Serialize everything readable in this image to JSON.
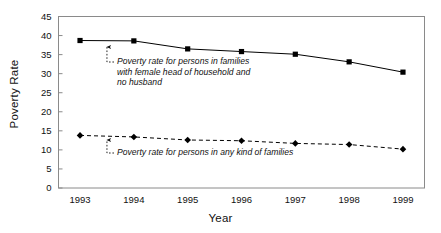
{
  "chart_data": {
    "type": "line",
    "title": "",
    "xlabel": "Year",
    "ylabel": "Poverty Rate",
    "categories": [
      "1993",
      "1994",
      "1995",
      "1996",
      "1997",
      "1998",
      "1999"
    ],
    "x": [
      1993,
      1994,
      1995,
      1996,
      1997,
      1998,
      1999
    ],
    "xlim": [
      1992.6,
      1999.4
    ],
    "ylim": [
      0,
      45
    ],
    "yticks": [
      0,
      5,
      10,
      15,
      20,
      25,
      30,
      35,
      40,
      45
    ],
    "ytick_labels": [
      "0",
      "5",
      "10",
      "15",
      "20",
      "25",
      "30",
      "35",
      "40",
      "45"
    ],
    "grid": false,
    "legend": "none",
    "series": [
      {
        "name": "Poverty rate for persons in families with female head of household and no husband",
        "style": "solid",
        "marker": "square",
        "color": "#000000",
        "values": [
          38.7,
          38.6,
          36.5,
          35.8,
          35.1,
          33.1,
          30.4
        ]
      },
      {
        "name": "Poverty rate for persons in any kind of families",
        "style": "dashed",
        "marker": "diamond",
        "color": "#000000",
        "values": [
          13.8,
          13.4,
          12.6,
          12.4,
          11.7,
          11.4,
          10.2
        ]
      }
    ],
    "annotations": [
      {
        "id": "annot-top",
        "text": "Poverty rate for persons in families\nwith female head of household and\nno husband",
        "points_to_series": 0,
        "arrow": "up"
      },
      {
        "id": "annot-bottom",
        "text": "Poverty rate for persons in any kind of families",
        "points_to_series": 1,
        "arrow": "up"
      }
    ]
  }
}
